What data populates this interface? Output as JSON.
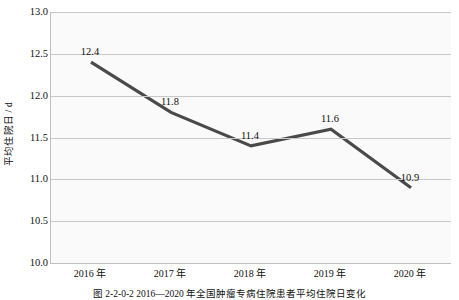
{
  "chart_data": {
    "type": "line",
    "title": "",
    "categories": [
      "2016 年",
      "2017 年",
      "2018 年",
      "2019 年",
      "2020 年"
    ],
    "values": [
      12.4,
      11.8,
      11.4,
      11.6,
      10.9
    ],
    "point_labels": [
      "12.4",
      "11.8",
      "11.4",
      "11.6",
      "10.9"
    ],
    "xlabel": "",
    "ylabel": "平均住院日 / d",
    "ylim": [
      10.0,
      13.0
    ],
    "ytick_labels": [
      "13.0",
      "12.5",
      "12.0",
      "11.5",
      "11.0",
      "10.5",
      "10.0"
    ],
    "ytick_values": [
      13.0,
      12.5,
      12.0,
      11.5,
      11.0,
      10.5,
      10.0
    ],
    "grid": true,
    "legend": false,
    "series_color": "#4a4a4a",
    "gridline_color": "#c8c8c8",
    "axis_color": "#c0c0c0",
    "plot_background": "#fafafa"
  },
  "caption": {
    "text": "图 2-2-0-2   2016—2020 年全国肿瘤专病住院患者平均住院日变化"
  }
}
